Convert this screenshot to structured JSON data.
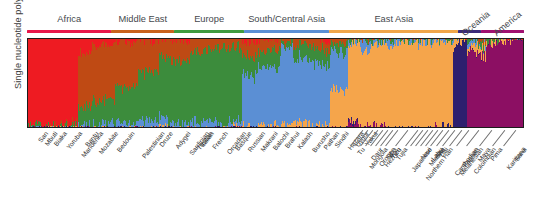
{
  "axis": {
    "ylabel": "Single nucleotide polymorphisms"
  },
  "caption": {
    "text": ""
  },
  "regions": [
    {
      "name": "Africa",
      "label": "Africa",
      "color": "#e8174b",
      "start": 0.0,
      "end": 0.17
    },
    {
      "name": "Middle East",
      "label": "Middle East",
      "color": "#c9621c",
      "start": 0.17,
      "end": 0.296
    },
    {
      "name": "Europe",
      "label": "Europe",
      "color": "#3f9b3f",
      "start": 0.296,
      "end": 0.437
    },
    {
      "name": "South/Central Asia",
      "label": "South/Central Asia",
      "color": "#5b8fd4",
      "start": 0.437,
      "end": 0.608
    },
    {
      "name": "East Asia",
      "label": "East Asia",
      "color": "#f0a64a",
      "start": 0.608,
      "end": 0.868
    },
    {
      "name": "Oceania",
      "label": "Oceania",
      "color": "#3b2a7a",
      "start": 0.868,
      "end": 0.913
    },
    {
      "name": "America",
      "label": "America",
      "color": "#a01070",
      "start": 0.913,
      "end": 1.0
    }
  ],
  "cluster_colors": {
    "africa": "#ee1b22",
    "mideast": "#bf4a14",
    "europe": "#3c8c3c",
    "scasia": "#5b8fd4",
    "eastasia": "#f5a54b",
    "oceania": "#2e1f6e",
    "america": "#8c0f63"
  },
  "chart_data": {
    "type": "bar",
    "title": "",
    "xlabel": "",
    "ylabel": "Single nucleotide polymorphisms",
    "ylim": [
      0,
      1
    ],
    "grid": false,
    "legend_position": "none",
    "note": "STRUCTURE-style stacked admixture barplot, K=7 ancestry clusters; each thin vertical bar is one individual, segment heights are ancestry proportions summing to 1.",
    "series": [
      {
        "name": "Africa cluster",
        "color": "#ee1b22"
      },
      {
        "name": "Middle East cluster",
        "color": "#bf4a14"
      },
      {
        "name": "Europe cluster",
        "color": "#3c8c3c"
      },
      {
        "name": "South/Central Asia cluster",
        "color": "#5b8fd4"
      },
      {
        "name": "East Asia cluster",
        "color": "#f5a54b"
      },
      {
        "name": "Oceania cluster",
        "color": "#2e1f6e"
      },
      {
        "name": "America cluster",
        "color": "#8c0f63"
      }
    ],
    "categories": [
      "San",
      "Mbuti",
      "Biaka",
      "Yoruba",
      "Mandenka",
      "Bantu",
      "Mozabite",
      "Bedouin",
      "Palestinian",
      "Druze",
      "Adygei",
      "Sardinian",
      "Tuscan",
      "Italian",
      "French",
      "Orcadian",
      "Basque",
      "Russian",
      "Makrani",
      "Balochi",
      "Brahui",
      "Kalash",
      "Burusho",
      "Pathan",
      "Sindhi",
      "Hazara",
      "Uygur",
      "Yakut",
      "Tu",
      "Mongola",
      "Daur",
      "Oroqen",
      "Hezhen",
      "Sibo",
      "Yizu",
      "Tujia",
      "Japanese",
      "Northern Han",
      "Naxi",
      "Miaozu",
      "Lahu",
      "She",
      "Dai",
      "Melanesian",
      "Cambodian",
      "Papuan",
      "Colombian",
      "Maya",
      "Pima",
      "Karitiana",
      "Surui"
    ],
    "populations": [
      {
        "label": "San",
        "region": "Africa",
        "n": 7,
        "admix": [
          0.99,
          0.0,
          0.01,
          0.0,
          0.0,
          0.0,
          0.0
        ]
      },
      {
        "label": "Mbuti",
        "region": "Africa",
        "n": 13,
        "admix": [
          0.99,
          0.0,
          0.01,
          0.0,
          0.0,
          0.0,
          0.0
        ]
      },
      {
        "label": "Biaka",
        "region": "Africa",
        "n": 22,
        "admix": [
          0.99,
          0.0,
          0.01,
          0.0,
          0.0,
          0.0,
          0.0
        ]
      },
      {
        "label": "Yoruba",
        "region": "Africa",
        "n": 21,
        "admix": [
          0.98,
          0.01,
          0.01,
          0.0,
          0.0,
          0.0,
          0.0
        ]
      },
      {
        "label": "Mandenka",
        "region": "Africa",
        "n": 22,
        "admix": [
          0.98,
          0.01,
          0.01,
          0.0,
          0.0,
          0.0,
          0.0
        ]
      },
      {
        "label": "Bantu",
        "region": "Africa",
        "n": 12,
        "admix": [
          0.97,
          0.02,
          0.01,
          0.0,
          0.0,
          0.0,
          0.0
        ]
      },
      {
        "label": "Mozabite",
        "region": "Middle East",
        "n": 27,
        "admix": [
          0.16,
          0.62,
          0.2,
          0.02,
          0.0,
          0.0,
          0.0
        ]
      },
      {
        "label": "Bedouin",
        "region": "Middle East",
        "n": 45,
        "admix": [
          0.06,
          0.64,
          0.27,
          0.03,
          0.0,
          0.0,
          0.0
        ]
      },
      {
        "label": "Palestinian",
        "region": "Middle East",
        "n": 44,
        "admix": [
          0.03,
          0.52,
          0.41,
          0.04,
          0.0,
          0.0,
          0.0
        ]
      },
      {
        "label": "Druze",
        "region": "Middle East",
        "n": 42,
        "admix": [
          0.01,
          0.35,
          0.58,
          0.06,
          0.0,
          0.0,
          0.0
        ]
      },
      {
        "label": "Adygei",
        "region": "Europe",
        "n": 17,
        "admix": [
          0.01,
          0.18,
          0.7,
          0.1,
          0.01,
          0.0,
          0.0
        ]
      },
      {
        "label": "Sardinian",
        "region": "Europe",
        "n": 28,
        "admix": [
          0.01,
          0.24,
          0.72,
          0.03,
          0.0,
          0.0,
          0.0
        ]
      },
      {
        "label": "Tuscan",
        "region": "Europe",
        "n": 8,
        "admix": [
          0.01,
          0.22,
          0.73,
          0.04,
          0.0,
          0.0,
          0.0
        ]
      },
      {
        "label": "Italian",
        "region": "Europe",
        "n": 13,
        "admix": [
          0.01,
          0.19,
          0.76,
          0.04,
          0.0,
          0.0,
          0.0
        ]
      },
      {
        "label": "French",
        "region": "Europe",
        "n": 29,
        "admix": [
          0.0,
          0.14,
          0.8,
          0.06,
          0.0,
          0.0,
          0.0
        ]
      },
      {
        "label": "Orcadian",
        "region": "Europe",
        "n": 16,
        "admix": [
          0.0,
          0.12,
          0.83,
          0.05,
          0.0,
          0.0,
          0.0
        ]
      },
      {
        "label": "Basque",
        "region": "Europe",
        "n": 24,
        "admix": [
          0.0,
          0.1,
          0.88,
          0.02,
          0.0,
          0.0,
          0.0
        ]
      },
      {
        "label": "Russian",
        "region": "Europe",
        "n": 25,
        "admix": [
          0.0,
          0.09,
          0.83,
          0.07,
          0.01,
          0.0,
          0.0
        ]
      },
      {
        "label": "Makrani",
        "region": "South/Central Asia",
        "n": 25,
        "admix": [
          0.02,
          0.17,
          0.22,
          0.58,
          0.01,
          0.0,
          0.0
        ]
      },
      {
        "label": "Balochi",
        "region": "South/Central Asia",
        "n": 24,
        "admix": [
          0.01,
          0.12,
          0.2,
          0.66,
          0.01,
          0.0,
          0.0
        ]
      },
      {
        "label": "Brahui",
        "region": "South/Central Asia",
        "n": 25,
        "admix": [
          0.01,
          0.12,
          0.19,
          0.67,
          0.01,
          0.0,
          0.0
        ]
      },
      {
        "label": "Kalash",
        "region": "South/Central Asia",
        "n": 25,
        "admix": [
          0.0,
          0.05,
          0.09,
          0.85,
          0.01,
          0.0,
          0.0
        ]
      },
      {
        "label": "Burusho",
        "region": "South/Central Asia",
        "n": 25,
        "admix": [
          0.0,
          0.07,
          0.15,
          0.74,
          0.04,
          0.0,
          0.0
        ]
      },
      {
        "label": "Pathan",
        "region": "South/Central Asia",
        "n": 23,
        "admix": [
          0.0,
          0.09,
          0.19,
          0.7,
          0.02,
          0.0,
          0.0
        ]
      },
      {
        "label": "Sindhi",
        "region": "South/Central Asia",
        "n": 24,
        "admix": [
          0.01,
          0.1,
          0.19,
          0.68,
          0.02,
          0.0,
          0.0
        ]
      },
      {
        "label": "Hazara",
        "region": "South/Central Asia",
        "n": 25,
        "admix": [
          0.0,
          0.04,
          0.08,
          0.43,
          0.45,
          0.0,
          0.0
        ]
      },
      {
        "label": "Uygur",
        "region": "South/Central Asia",
        "n": 10,
        "admix": [
          0.0,
          0.05,
          0.12,
          0.42,
          0.41,
          0.0,
          0.0
        ]
      },
      {
        "label": "Yakut",
        "region": "East Asia",
        "n": 25,
        "admix": [
          0.0,
          0.0,
          0.01,
          0.03,
          0.9,
          0.01,
          0.05
        ]
      },
      {
        "label": "Tu",
        "region": "East Asia",
        "n": 10,
        "admix": [
          0.0,
          0.01,
          0.02,
          0.1,
          0.87,
          0.0,
          0.0
        ]
      },
      {
        "label": "Mongola",
        "region": "East Asia",
        "n": 10,
        "admix": [
          0.0,
          0.01,
          0.02,
          0.08,
          0.88,
          0.0,
          0.01
        ]
      },
      {
        "label": "Daur",
        "region": "East Asia",
        "n": 10,
        "admix": [
          0.0,
          0.0,
          0.01,
          0.04,
          0.94,
          0.0,
          0.01
        ]
      },
      {
        "label": "Oroqen",
        "region": "East Asia",
        "n": 10,
        "admix": [
          0.0,
          0.0,
          0.01,
          0.03,
          0.95,
          0.0,
          0.01
        ]
      },
      {
        "label": "Hezhen",
        "region": "East Asia",
        "n": 10,
        "admix": [
          0.0,
          0.0,
          0.01,
          0.02,
          0.96,
          0.0,
          0.01
        ]
      },
      {
        "label": "Sibo",
        "region": "East Asia",
        "n": 9,
        "admix": [
          0.0,
          0.01,
          0.02,
          0.06,
          0.91,
          0.0,
          0.0
        ]
      },
      {
        "label": "Yizu",
        "region": "East Asia",
        "n": 10,
        "admix": [
          0.0,
          0.0,
          0.01,
          0.03,
          0.96,
          0.0,
          0.0
        ]
      },
      {
        "label": "Tujia",
        "region": "East Asia",
        "n": 10,
        "admix": [
          0.0,
          0.0,
          0.01,
          0.02,
          0.97,
          0.0,
          0.0
        ]
      },
      {
        "label": "Japanese",
        "region": "East Asia",
        "n": 29,
        "admix": [
          0.0,
          0.0,
          0.01,
          0.02,
          0.97,
          0.0,
          0.0
        ]
      },
      {
        "label": "Northern Han",
        "region": "East Asia",
        "n": 10,
        "admix": [
          0.0,
          0.0,
          0.01,
          0.03,
          0.96,
          0.0,
          0.0
        ]
      },
      {
        "label": "Naxi",
        "region": "East Asia",
        "n": 9,
        "admix": [
          0.0,
          0.0,
          0.01,
          0.02,
          0.97,
          0.0,
          0.0
        ]
      },
      {
        "label": "Miaozu",
        "region": "East Asia",
        "n": 10,
        "admix": [
          0.0,
          0.0,
          0.01,
          0.02,
          0.97,
          0.0,
          0.0
        ]
      },
      {
        "label": "Lahu",
        "region": "East Asia",
        "n": 10,
        "admix": [
          0.0,
          0.0,
          0.0,
          0.01,
          0.98,
          0.0,
          0.01
        ]
      },
      {
        "label": "She",
        "region": "East Asia",
        "n": 10,
        "admix": [
          0.0,
          0.0,
          0.01,
          0.02,
          0.97,
          0.0,
          0.0
        ]
      },
      {
        "label": "Dai",
        "region": "East Asia",
        "n": 10,
        "admix": [
          0.0,
          0.0,
          0.0,
          0.01,
          0.98,
          0.01,
          0.0
        ]
      },
      {
        "label": "Cambodian",
        "region": "East Asia",
        "n": 11,
        "admix": [
          0.0,
          0.0,
          0.01,
          0.02,
          0.95,
          0.02,
          0.0
        ]
      },
      {
        "label": "Melanesian",
        "region": "Oceania",
        "n": 11,
        "admix": [
          0.0,
          0.0,
          0.0,
          0.01,
          0.07,
          0.92,
          0.0
        ]
      },
      {
        "label": "Papuan",
        "region": "Oceania",
        "n": 17,
        "admix": [
          0.0,
          0.0,
          0.0,
          0.0,
          0.02,
          0.98,
          0.0
        ]
      },
      {
        "label": "Colombian",
        "region": "America",
        "n": 13,
        "admix": [
          0.0,
          0.0,
          0.02,
          0.01,
          0.05,
          0.0,
          0.92
        ]
      },
      {
        "label": "Maya",
        "region": "America",
        "n": 25,
        "admix": [
          0.0,
          0.01,
          0.04,
          0.01,
          0.08,
          0.0,
          0.86
        ]
      },
      {
        "label": "Pima",
        "region": "America",
        "n": 25,
        "admix": [
          0.0,
          0.0,
          0.01,
          0.0,
          0.03,
          0.0,
          0.96
        ]
      },
      {
        "label": "Karitiana",
        "region": "America",
        "n": 24,
        "admix": [
          0.0,
          0.0,
          0.0,
          0.0,
          0.01,
          0.0,
          0.99
        ]
      },
      {
        "label": "Surui",
        "region": "America",
        "n": 21,
        "admix": [
          0.0,
          0.0,
          0.0,
          0.0,
          0.0,
          0.0,
          1.0
        ]
      }
    ]
  }
}
